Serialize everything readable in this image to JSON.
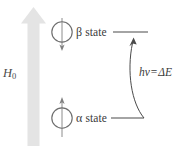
{
  "figure": {
    "background_color": "#ffffff"
  },
  "field_arrow": {
    "label": "H",
    "label_subscript": "0",
    "label_full": "H0",
    "direction": "up",
    "color": "#e3e3e3",
    "meaning": "applied magnetic field"
  },
  "states": [
    {
      "id": "beta",
      "symbol": "β",
      "label": "state",
      "full_label": "β state",
      "spin_direction": "down",
      "energy_level": "upper",
      "circle_color": "#6e6e6e",
      "arrow_color": "#7a7a7a",
      "level_line_color": "#4a4a4a"
    },
    {
      "id": "alpha",
      "symbol": "α",
      "label": "state",
      "full_label": "α state",
      "spin_direction": "up",
      "energy_level": "lower",
      "circle_color": "#6e6e6e",
      "arrow_color": "#7a7a7a",
      "level_line_color": "#4a4a4a"
    }
  ],
  "transition": {
    "photon_term": "hν",
    "equals": "=",
    "energy_term": "ΔE",
    "full_label": "hν = ΔE",
    "direction": "upward",
    "from_state": "alpha",
    "to_state": "beta",
    "arrow_color": "#4a4a4a"
  }
}
